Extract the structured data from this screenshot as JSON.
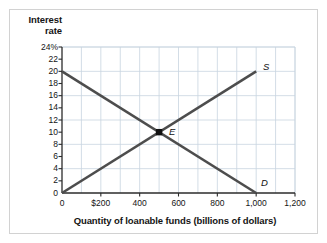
{
  "chart_data": {
    "type": "line",
    "title": "",
    "xlabel": "Quantity of loanable funds (billions of dollars)",
    "ylabel": "Interest rate",
    "ylabel_line1": "Interest",
    "ylabel_line2": "rate",
    "xlim": [
      0,
      1200
    ],
    "ylim": [
      0,
      24
    ],
    "grid": true,
    "grid_x_step": 100,
    "grid_y_step": 4,
    "xticks": [
      0,
      200,
      400,
      600,
      800,
      1000,
      1200
    ],
    "xtick_labels": [
      "0",
      "$200",
      "400",
      "600",
      "800",
      "1,000",
      "1,200"
    ],
    "yticks": [
      0,
      2,
      4,
      6,
      8,
      10,
      12,
      14,
      16,
      18,
      20,
      22,
      24
    ],
    "ytick_labels": [
      "0",
      "2",
      "4",
      "6",
      "8",
      "10",
      "12",
      "14",
      "16",
      "18",
      "20",
      "22",
      "24%"
    ],
    "legend_position": "inline-curve-labels",
    "series": [
      {
        "name": "Demand",
        "label": "D",
        "color": "#4d4d4d",
        "points": [
          [
            0,
            20
          ],
          [
            1000,
            0
          ]
        ]
      },
      {
        "name": "Supply",
        "label": "S",
        "color": "#4d4d4d",
        "points": [
          [
            0,
            0
          ],
          [
            1000,
            20
          ]
        ]
      }
    ],
    "annotations": [
      {
        "name": "equilibrium",
        "label": "E",
        "x": 500,
        "y": 10,
        "marker": "square",
        "color": "#111111"
      }
    ]
  },
  "colors": {
    "curve": "#4d4d4d",
    "grid": "#c8d4e0",
    "axis": "#2b2b2b",
    "frame": "#d2d2d2",
    "text": "#141414",
    "marker": "#111111",
    "background": "#ffffff"
  }
}
